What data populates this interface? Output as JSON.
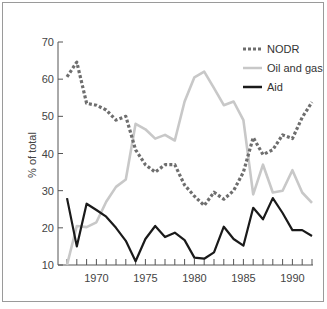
{
  "chart_data": {
    "type": "line",
    "title": "",
    "xlabel": "",
    "ylabel": "% of total",
    "ylim": [
      10,
      70
    ],
    "xlim": [
      1967,
      1992
    ],
    "yticks": [
      10,
      20,
      30,
      40,
      50,
      60,
      70
    ],
    "xticks_labeled": [
      1970,
      1975,
      1980,
      1985,
      1990
    ],
    "grid": false,
    "legend_position": "top-right",
    "x": [
      1967,
      1968,
      1969,
      1970,
      1971,
      1972,
      1973,
      1974,
      1975,
      1976,
      1977,
      1978,
      1979,
      1980,
      1981,
      1982,
      1983,
      1984,
      1985,
      1986,
      1987,
      1988,
      1989,
      1990,
      1991,
      1992
    ],
    "series": [
      {
        "name": "NODR",
        "style": "dotted",
        "color": "#6e6e6e",
        "values": [
          60.6,
          64.6,
          53.5,
          53,
          51.7,
          49,
          50,
          41,
          37,
          35,
          37,
          37,
          31.5,
          28.5,
          26,
          29.6,
          27.7,
          30,
          35,
          44.3,
          39.7,
          41,
          45,
          44,
          49.7,
          53.8
        ]
      },
      {
        "name": "Oil and gas",
        "style": "solid",
        "color": "#c8c8c8",
        "values": [
          10,
          20.5,
          20.2,
          21.5,
          27,
          31,
          33,
          48,
          46.5,
          44,
          45,
          43.5,
          54,
          60.5,
          62,
          57.6,
          53,
          54,
          49,
          29,
          37,
          29.5,
          30,
          35.5,
          29.5,
          26.7
        ]
      },
      {
        "name": "Aid",
        "style": "solid",
        "color": "#1a1a1a",
        "values": [
          28,
          15,
          26.5,
          24.8,
          23,
          20,
          16.5,
          11,
          17,
          20.5,
          17.5,
          18.7,
          16.7,
          12,
          11.7,
          13.4,
          20.3,
          17,
          15.2,
          25.4,
          22.3,
          28,
          24,
          19.4,
          19.4,
          17.8
        ]
      }
    ]
  },
  "axes": {
    "ylabel": "% of total",
    "y_tick_labels": [
      "10",
      "20",
      "30",
      "40",
      "50",
      "60",
      "70"
    ],
    "x_tick_labels": [
      "1970",
      "1975",
      "1980",
      "1985",
      "1990"
    ]
  },
  "legend": {
    "items": [
      {
        "label": "NODR"
      },
      {
        "label": "Oil and gas"
      },
      {
        "label": "Aid"
      }
    ]
  }
}
